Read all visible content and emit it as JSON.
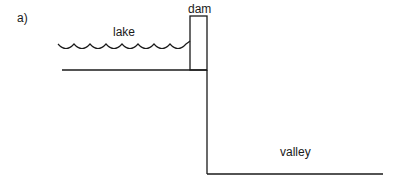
{
  "figure": {
    "panel_label": "a)",
    "labels": {
      "dam": "dam",
      "lake": "lake",
      "valley": "valley"
    },
    "colors": {
      "line": "#1a1a1a",
      "background": "#ffffff"
    }
  }
}
